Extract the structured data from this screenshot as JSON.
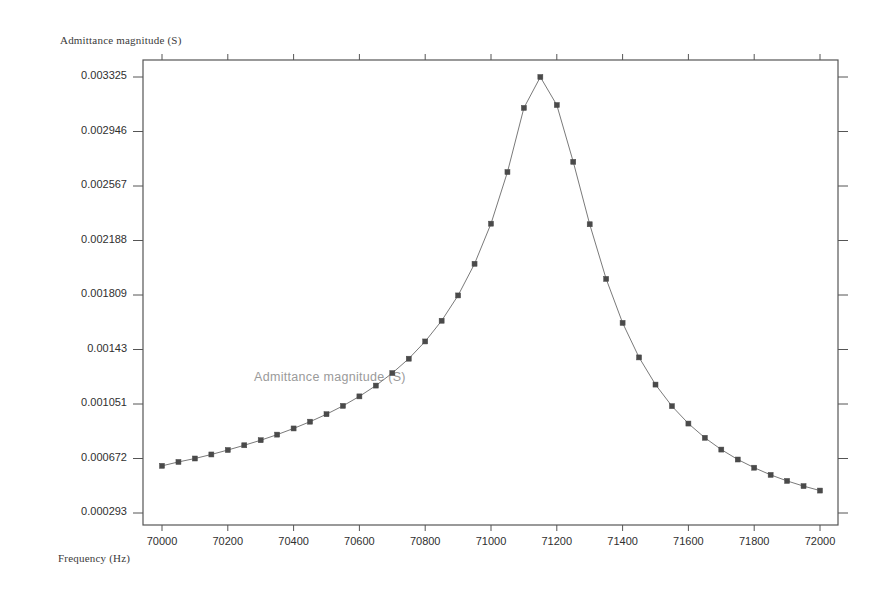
{
  "chart_data": {
    "type": "line",
    "title": "",
    "xlabel": "Frequency (Hz)",
    "ylabel": "Admittance magnitude (S)",
    "series_label": "Admittance magnitude (S)",
    "xlim": [
      70000,
      72000
    ],
    "ylim": [
      0.000293,
      0.003325
    ],
    "grid": false,
    "legend_position": "inside-plot-left",
    "marker": "square",
    "marker_color": "#4a4a4a",
    "line_color": "#7a7a7a",
    "axis_color": "#555555",
    "background": "#ffffff",
    "xticks": [
      70000,
      70200,
      70400,
      70600,
      70800,
      71000,
      71200,
      71400,
      71600,
      71800,
      72000
    ],
    "xtick_labels": [
      "70000",
      "70200",
      "70400",
      "70600",
      "70800",
      "71000",
      "71200",
      "71400",
      "71600",
      "71800",
      "72000"
    ],
    "yticks": [
      0.003325,
      0.002946,
      0.002567,
      0.002188,
      0.001809,
      0.00143,
      0.001051,
      0.000672,
      0.000293
    ],
    "ytick_labels": [
      "0.003325",
      "0.002946",
      "0.002567",
      "0.002188",
      "0.001809",
      "0.00143",
      "0.001051",
      "0.000672",
      "0.000293"
    ],
    "x": [
      70000,
      70050,
      70100,
      70150,
      70200,
      70250,
      70300,
      70350,
      70400,
      70450,
      70500,
      70550,
      70600,
      70650,
      70700,
      70750,
      70800,
      70850,
      70900,
      70950,
      71000,
      71050,
      71100,
      71150,
      71200,
      71250,
      71300,
      71350,
      71400,
      71450,
      71500,
      71550,
      71600,
      71650,
      71700,
      71750,
      71800,
      71850,
      71900,
      71950,
      72000
    ],
    "values": [
      0.000621,
      0.000648,
      0.000672,
      0.0007,
      0.000731,
      0.000764,
      0.000799,
      0.000838,
      0.000881,
      0.000928,
      0.00098,
      0.001038,
      0.001104,
      0.001179,
      0.001266,
      0.001366,
      0.001486,
      0.00163,
      0.001806,
      0.002026,
      0.002305,
      0.002664,
      0.00311,
      0.003325,
      0.00313,
      0.002735,
      0.002301,
      0.001921,
      0.001615,
      0.001375,
      0.001186,
      0.001036,
      0.000915,
      0.000816,
      0.000734,
      0.000665,
      0.000608,
      0.000558,
      0.000516,
      0.00048,
      0.000449
    ]
  }
}
